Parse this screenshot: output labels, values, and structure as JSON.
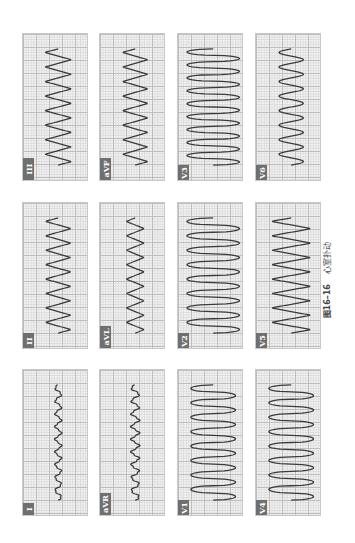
{
  "figure": {
    "number": "图16–16",
    "title": "心室扑动",
    "orientation": "rotated 90° counter-clockwise"
  },
  "panels": [
    {
      "lead": "III",
      "col": 0,
      "row": 0,
      "amp": 0.42,
      "cycles": 8,
      "style": "zigzag"
    },
    {
      "lead": "II",
      "col": 0,
      "row": 1,
      "amp": 0.4,
      "cycles": 8,
      "style": "zigzag"
    },
    {
      "lead": "I",
      "col": 0,
      "row": 2,
      "amp": 0.12,
      "cycles": 9,
      "style": "small"
    },
    {
      "lead": "aVF",
      "col": 1,
      "row": 0,
      "amp": 0.4,
      "cycles": 8,
      "style": "zigzag"
    },
    {
      "lead": "aVL",
      "col": 1,
      "row": 1,
      "amp": 0.28,
      "cycles": 8,
      "style": "zigzag"
    },
    {
      "lead": "aVR",
      "col": 1,
      "row": 2,
      "amp": 0.15,
      "cycles": 9,
      "style": "small"
    },
    {
      "lead": "V3",
      "col": 2,
      "row": 0,
      "amp": 0.82,
      "cycles": 9,
      "style": "wide"
    },
    {
      "lead": "V2",
      "col": 2,
      "row": 1,
      "amp": 0.82,
      "cycles": 8,
      "style": "wide"
    },
    {
      "lead": "V1",
      "col": 2,
      "row": 2,
      "amp": 0.7,
      "cycles": 8,
      "style": "wide"
    },
    {
      "lead": "V6",
      "col": 3,
      "row": 0,
      "amp": 0.38,
      "cycles": 8,
      "style": "sine"
    },
    {
      "lead": "V5",
      "col": 3,
      "row": 1,
      "amp": 0.62,
      "cycles": 8,
      "style": "zigzag"
    },
    {
      "lead": "V4",
      "col": 3,
      "row": 2,
      "amp": 0.7,
      "cycles": 8,
      "style": "wide"
    }
  ],
  "layout": {
    "col_x": [
      22,
      99,
      177,
      255
    ],
    "col_w": 66,
    "row_y": [
      33,
      202,
      369
    ],
    "row_h": [
      148,
      147,
      147
    ]
  },
  "colors": {
    "trace": "#3a3a3a",
    "label_bg": "#6f6f6f"
  }
}
